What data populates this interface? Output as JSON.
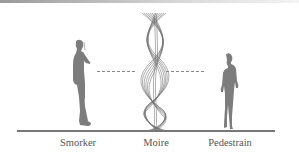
{
  "diagram": {
    "labels": {
      "smoker": "Smorker",
      "moire": "Moire",
      "pedestrian": "Pedestrain"
    },
    "colors": {
      "figure": "#7d7d7d",
      "moire_lines": "#555555",
      "ground": "#777777",
      "label": "#555555"
    }
  }
}
